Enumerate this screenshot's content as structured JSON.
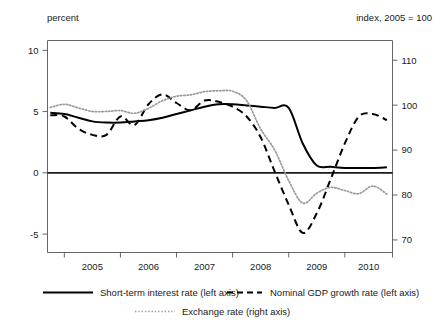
{
  "chart_data": {
    "type": "line",
    "title": "",
    "subtitle": "",
    "xlabel": "",
    "ylabel": "percent",
    "y2label": "index, 2005 = 100",
    "grid": false,
    "legend_position": "bottom",
    "x": [
      2004.75,
      2005.0,
      2005.25,
      2005.5,
      2005.75,
      2006.0,
      2006.25,
      2006.5,
      2006.75,
      2007.0,
      2007.25,
      2007.5,
      2007.75,
      2008.0,
      2008.25,
      2008.5,
      2008.75,
      2009.0,
      2009.25,
      2009.5,
      2009.75,
      2010.0,
      2010.25,
      2010.5,
      2010.75
    ],
    "xtick_labels": [
      "2005",
      "2006",
      "2007",
      "2008",
      "2009",
      "2010"
    ],
    "xtick_values": [
      2005,
      2006,
      2007,
      2008,
      2009,
      2010
    ],
    "xlim": [
      2004.7,
      2010.85
    ],
    "ylim": [
      -6.5,
      10.8
    ],
    "ytick_labels": [
      "10",
      "5",
      "0",
      "-5"
    ],
    "ytick_values": [
      10,
      5,
      0,
      -5
    ],
    "y2lim": [
      67.2,
      114.4
    ],
    "y2tick_labels": [
      "110",
      "100",
      "90",
      "80",
      "70"
    ],
    "y2tick_values": [
      110,
      100,
      90,
      80,
      70
    ],
    "series": [
      {
        "name": "Short-term interest rate (left axis)",
        "axis": "left",
        "style": "solid",
        "color": "#000000",
        "values": [
          4.9,
          4.8,
          4.5,
          4.2,
          4.1,
          4.1,
          4.2,
          4.3,
          4.5,
          4.8,
          5.1,
          5.4,
          5.6,
          5.6,
          5.5,
          5.4,
          5.3,
          5.3,
          2.4,
          0.6,
          0.5,
          0.4,
          0.4,
          0.4,
          0.45
        ]
      },
      {
        "name": "Nominal GDP growth rate  (left axis)",
        "axis": "left",
        "style": "dashed",
        "color": "#000000",
        "values": [
          4.7,
          4.6,
          3.6,
          3.1,
          3.1,
          4.6,
          3.9,
          5.6,
          6.4,
          5.7,
          5.1,
          5.9,
          5.8,
          5.4,
          4.6,
          2.9,
          0.1,
          -2.6,
          -4.9,
          -3.3,
          -0.5,
          2.4,
          4.6,
          4.8,
          4.3
        ]
      },
      {
        "name": "Exchange rate (right axis)",
        "axis": "right",
        "style": "dotted",
        "color": "#9a9a9a",
        "values": [
          99.5,
          100.2,
          99.4,
          98.6,
          98.6,
          98.8,
          98.2,
          99.3,
          101.0,
          102.0,
          102.3,
          103.0,
          103.2,
          103.1,
          101.0,
          94.7,
          90.0,
          83.2,
          78.2,
          80.4,
          81.7,
          81.0,
          80.3,
          82.0,
          80.2
        ]
      }
    ]
  },
  "legend": {
    "items": [
      {
        "label": "Short-term interest rate (left axis)",
        "style": "solid"
      },
      {
        "label": "Nominal GDP growth rate  (left axis)",
        "style": "dashed"
      },
      {
        "label": "Exchange rate (right axis)",
        "style": "dotted"
      }
    ]
  }
}
